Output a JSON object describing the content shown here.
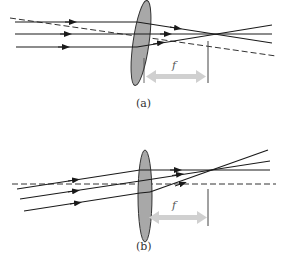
{
  "figure": {
    "panel_a": {
      "caption": "(a)",
      "focal_label": "f",
      "description": "Parallel rays along the axis converge to focal point on a converging lens; dashed line through lens center"
    },
    "panel_b": {
      "caption": "(b)",
      "focal_label": "f",
      "description": "Parallel oblique rays converge to a point in the focal plane; dashed optical axis horizontal"
    },
    "colors": {
      "ray": "#1a1a1a",
      "lens_fill": "#a8a8a8",
      "lens_stroke": "#333333",
      "focal_arrow": "#d0d0d0",
      "dashed_line": "#333333"
    }
  }
}
